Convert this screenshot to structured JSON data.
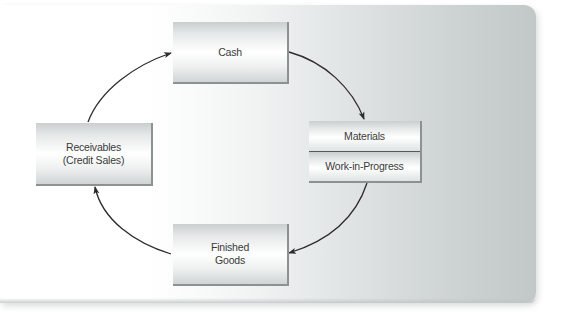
{
  "diagram": {
    "type": "cycle",
    "nodes": [
      {
        "id": "cash",
        "label": "Cash"
      },
      {
        "id": "materials_wip",
        "sections": [
          "Materials",
          "Work-in-Progress"
        ]
      },
      {
        "id": "finished_goods",
        "lines": [
          "Finished",
          "Goods"
        ]
      },
      {
        "id": "receivables",
        "lines": [
          "Receivables",
          "(Credit Sales)"
        ]
      }
    ],
    "edges": [
      {
        "from": "cash",
        "to": "materials_wip"
      },
      {
        "from": "materials_wip",
        "to": "finished_goods"
      },
      {
        "from": "finished_goods",
        "to": "receivables"
      },
      {
        "from": "receivables",
        "to": "cash"
      }
    ],
    "colors": {
      "arrow": "#2b2b2b",
      "box_shadow_edge": "#8c9191",
      "divider": "#555a5a",
      "text": "#3a3a3a",
      "panel_right": "#c2c8c8"
    }
  }
}
